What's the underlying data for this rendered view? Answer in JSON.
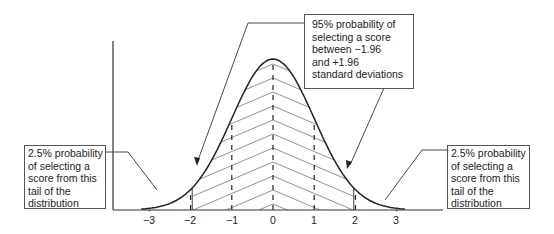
{
  "diagram": {
    "type": "normal-distribution",
    "x_axis": {
      "ticks": [
        "−3",
        "−2",
        "−1",
        "0",
        "1",
        "2",
        "3"
      ],
      "range": [
        -3.5,
        3.5
      ]
    },
    "shaded_region": {
      "from": -1.96,
      "to": 1.96,
      "pattern": "chevron-hatch"
    },
    "dashed_lines_at": [
      -3,
      -2,
      -1,
      0,
      1,
      2,
      3
    ]
  },
  "callouts": {
    "center": {
      "lines": [
        "95% probability of",
        "selecting a score",
        "between −1.96",
        "and +1.96",
        "standard deviations"
      ]
    },
    "left": {
      "lines": [
        "2.5% probability",
        "of selecting a",
        "score from this",
        "tail of the",
        "distribution"
      ]
    },
    "right": {
      "lines": [
        "2.5% probability",
        "of selecting a",
        "score from this",
        "tail of the",
        "distribution"
      ]
    }
  },
  "colors": {
    "curve": "#222222",
    "axis": "#333333",
    "hatch": "#777777",
    "box_border": "#555555"
  }
}
